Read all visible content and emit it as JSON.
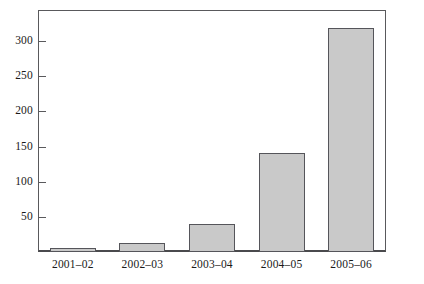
{
  "chart_data": {
    "type": "bar",
    "title": "",
    "subtitle": "",
    "xlabel": "",
    "ylabel": "",
    "categories": [
      "2001–02",
      "2002–03",
      "2003–04",
      "2004–05",
      "2005–06"
    ],
    "values": [
      5,
      13,
      40,
      141,
      319
    ],
    "ylim": [
      0,
      345
    ],
    "yticks": [
      50,
      100,
      150,
      200,
      250,
      300
    ],
    "ytick_labels": [
      "50",
      "100",
      "150",
      "200",
      "250",
      "300"
    ],
    "grid": false,
    "legend": null,
    "legend_position": "none",
    "annotations": [],
    "series": [
      {
        "name": "",
        "values": [
          5,
          13,
          40,
          141,
          319
        ]
      }
    ],
    "colors": {
      "bar_fill": "#c9c9c9",
      "bar_edge": "#55555a",
      "axis": "#59595c",
      "text": "#1a1a1a",
      "background": "#ffffff"
    }
  }
}
